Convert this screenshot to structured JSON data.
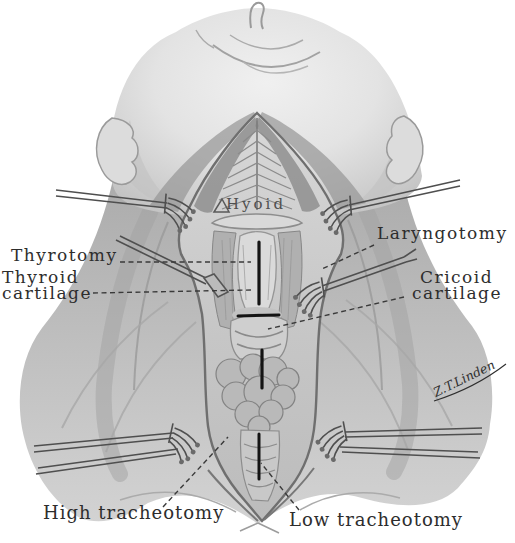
{
  "labels": {
    "hyoid": "Hyoid",
    "thyrotomy": "Thyrotomy",
    "thyroid_cartilage": {
      "line1": "Thyroid",
      "line2": "cartilage"
    },
    "laryngotomy": "Laryngotomy",
    "cricoid_cartilage": {
      "line1": "Cricoid",
      "line2": "cartilage"
    },
    "high_tracheotomy": "High tracheotomy",
    "low_tracheotomy": "Low tracheotomy"
  },
  "signature": "Z.T.Linden",
  "colors": {
    "paper": "#ffffff",
    "ink": "#2d2d2d",
    "ink_soft": "#4f4f4f",
    "incision": "#141414",
    "leader": "#3a3a3a",
    "instrument": "#4f4f4f",
    "wound_edge": "#6f6f6f"
  }
}
